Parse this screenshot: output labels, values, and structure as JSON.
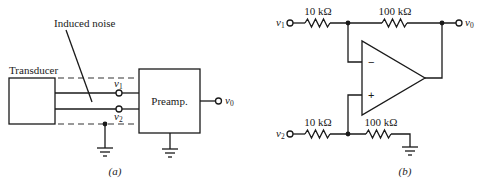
{
  "figure_a": {
    "caption": "(a)",
    "transducer_label": "Transducer",
    "preamp_label": "Preamp.",
    "noise_label": "Induced noise",
    "input1": {
      "symbol": "v",
      "subscript": "1"
    },
    "input2": {
      "symbol": "v",
      "subscript": "2"
    },
    "output": {
      "symbol": "v",
      "subscript": "0"
    }
  },
  "figure_b": {
    "caption": "(b)",
    "input1": {
      "symbol": "v",
      "subscript": "1"
    },
    "input2": {
      "symbol": "v",
      "subscript": "2"
    },
    "output": {
      "symbol": "v",
      "subscript": "0"
    },
    "r1_label": "10 kΩ",
    "rf_label": "100 kΩ",
    "r2_label": "10 kΩ",
    "r3_label": "100 kΩ",
    "minus_sign": "−",
    "plus_sign": "+"
  }
}
